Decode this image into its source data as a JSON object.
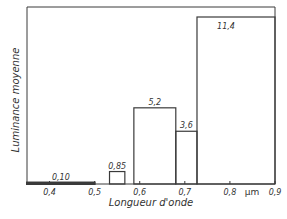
{
  "chart_data": {
    "type": "bar",
    "title": "",
    "xlabel": "Longueur d'onde",
    "ylabel": "Luminance moyenne",
    "x_unit": "µm",
    "xlim": [
      0.35,
      0.9
    ],
    "ylim": [
      0,
      11.4
    ],
    "grid": false,
    "legend": null,
    "x_ticks": [
      "0,4",
      "0,5",
      "0,6",
      "0,7",
      "0,8",
      "0,9"
    ],
    "x_tick_values": [
      0.4,
      0.5,
      0.6,
      0.7,
      0.8,
      0.9
    ],
    "bins": [
      {
        "x_start": 0.35,
        "x_end": 0.5,
        "value": 0.1,
        "label": "0,10"
      },
      {
        "x_start": 0.533,
        "x_end": 0.567,
        "value": 0.85,
        "label": "0,85"
      },
      {
        "x_start": 0.587,
        "x_end": 0.68,
        "value": 5.2,
        "label": "5,2"
      },
      {
        "x_start": 0.68,
        "x_end": 0.727,
        "value": 3.6,
        "label": "3,6"
      },
      {
        "x_start": 0.727,
        "x_end": 0.9,
        "value": 11.4,
        "label": "11,4"
      }
    ],
    "categories": [
      "0.35–0.50",
      "0.533–0.567",
      "0.587–0.68",
      "0.68–0.727",
      "0.727–0.90"
    ],
    "values": [
      0.1,
      0.85,
      5.2,
      3.6,
      11.4
    ]
  },
  "style": {
    "line_color": "#3a3a3a",
    "text_color": "#333333",
    "background": "#ffffff"
  }
}
